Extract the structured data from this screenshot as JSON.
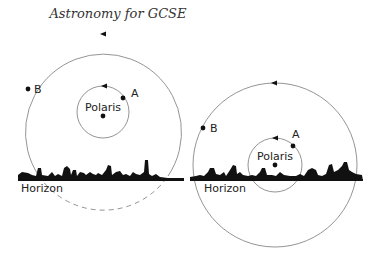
{
  "title": "Astronomy for GCSE",
  "left_diagram": {
    "star_a_label": "A",
    "star_b_label": "B",
    "pole_star_label": "Polaris",
    "horizon_label": "Horizon"
  },
  "right_diagram": {
    "star_a_label": "A",
    "star_b_label": "B",
    "pole_star_label": "Polaris",
    "horizon_label": "Horizon"
  }
}
